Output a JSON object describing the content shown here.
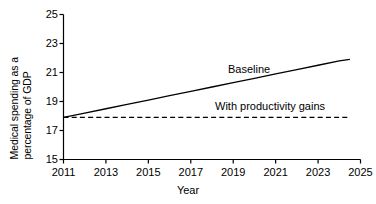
{
  "chart_data": {
    "type": "line",
    "title": "",
    "subtitle": "",
    "xlabel": "Year",
    "ylabel": "Medical spending as a percentage of GDP",
    "ylabel_line1": "Medical spending as a",
    "ylabel_line2": "percentage of GDP",
    "xlim": [
      2011,
      2025
    ],
    "ylim": [
      15,
      25
    ],
    "xticks": [
      2011,
      2013,
      2015,
      2017,
      2019,
      2021,
      2023,
      2025
    ],
    "yticks": [
      15,
      17,
      19,
      21,
      23,
      25
    ],
    "xtick_labels": [
      "2011",
      "2013",
      "2015",
      "2017",
      "2019",
      "2021",
      "2023",
      "2025"
    ],
    "ytick_labels": [
      "15",
      "17",
      "19",
      "21",
      "23",
      "25"
    ],
    "grid": false,
    "legend_position": "inline-annotation",
    "x": [
      2011,
      2012,
      2013,
      2014,
      2015,
      2016,
      2017,
      2018,
      2019,
      2020,
      2021,
      2022,
      2023,
      2024,
      2024.5
    ],
    "series": [
      {
        "name": "Baseline",
        "style": "solid",
        "color": "#000000",
        "values": [
          17.9,
          18.2,
          18.5,
          18.8,
          19.1,
          19.4,
          19.7,
          20.0,
          20.3,
          20.6,
          20.9,
          21.2,
          21.5,
          21.8,
          21.9
        ],
        "annotation": "Baseline"
      },
      {
        "name": "With productivity gains",
        "style": "dashed",
        "color": "#000000",
        "values": [
          17.9,
          17.9,
          17.9,
          17.9,
          17.9,
          17.9,
          17.9,
          17.9,
          17.9,
          17.9,
          17.9,
          17.9,
          17.9,
          17.9,
          17.9
        ],
        "annotation": "With productivity gains"
      }
    ]
  },
  "annotations": {
    "baseline": "Baseline",
    "productivity": "With productivity gains"
  },
  "axes": {
    "x_axis_label": "Year",
    "y_axis_label_line1": "Medical spending as a",
    "y_axis_label_line2": "percentage of GDP"
  },
  "colors": {
    "background": "#ffffff",
    "axis": "#000000",
    "line": "#000000"
  }
}
